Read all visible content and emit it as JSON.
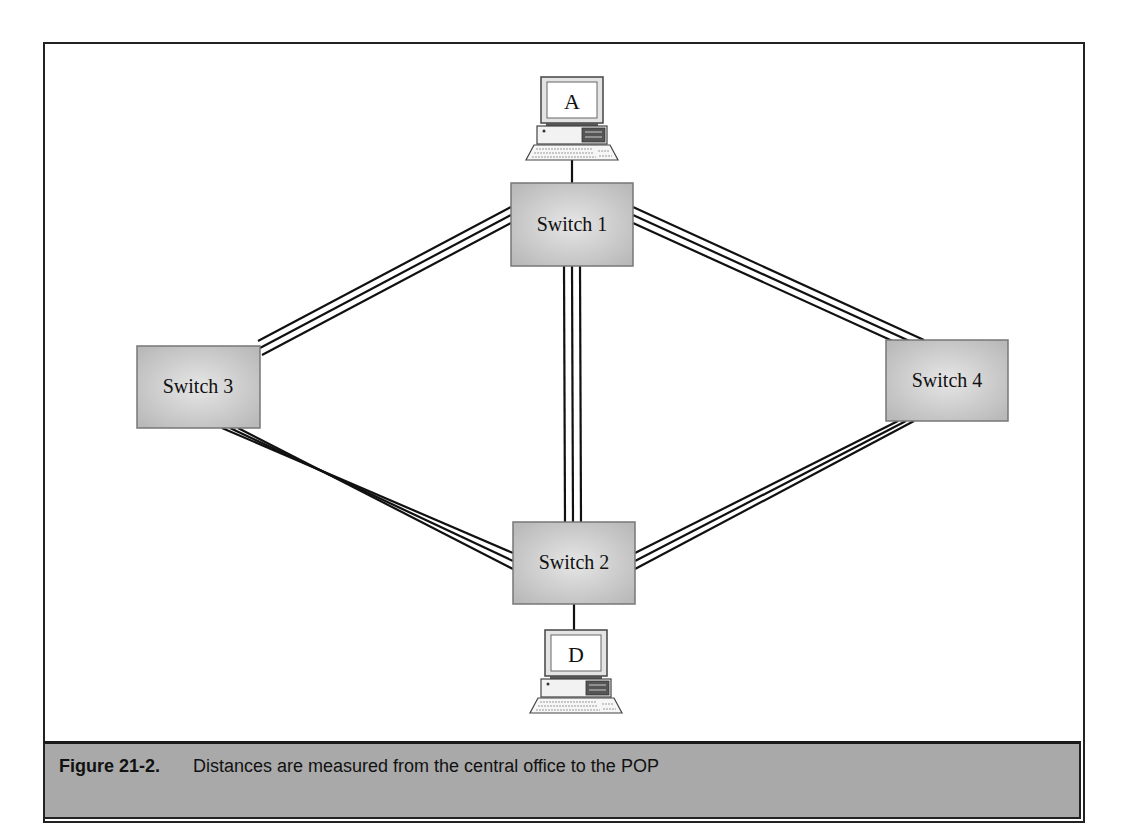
{
  "figure": {
    "number_label": "Figure 21-2.",
    "caption": "Distances are measured from the central office to the POP"
  },
  "nodes": {
    "computer_a": {
      "label": "A"
    },
    "computer_d": {
      "label": "D"
    },
    "switch_1": {
      "label": "Switch 1"
    },
    "switch_2": {
      "label": "Switch 2"
    },
    "switch_3": {
      "label": "Switch 3"
    },
    "switch_4": {
      "label": "Switch 4"
    }
  },
  "links": [
    {
      "from": "Computer A",
      "to": "Switch 1",
      "type": "single line"
    },
    {
      "from": "Switch 1",
      "to": "Switch 3",
      "type": "triple line"
    },
    {
      "from": "Switch 1",
      "to": "Switch 4",
      "type": "triple line"
    },
    {
      "from": "Switch 1",
      "to": "Switch 2",
      "type": "triple line"
    },
    {
      "from": "Switch 3",
      "to": "Switch 2",
      "type": "triple line"
    },
    {
      "from": "Switch 4",
      "to": "Switch 2",
      "type": "triple line"
    },
    {
      "from": "Switch 2",
      "to": "Computer D",
      "type": "single line"
    }
  ],
  "colors": {
    "switch_fill": "#c8c8c8",
    "caption_band": "#a9a9a9",
    "line": "#111111"
  }
}
